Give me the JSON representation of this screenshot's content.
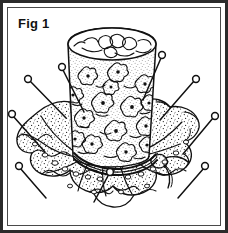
{
  "figure": {
    "caption": "Fig 1",
    "title": "Fig 1",
    "style": "black-and-white line drawing",
    "colors": {
      "background": "#ffffff",
      "ink": "#111111",
      "outer_border": "#2b2b2b",
      "inner_border": "#4a4a4a"
    },
    "illustration": {
      "body": {
        "name": "thimble-shaped pincushion body",
        "pattern": "small floral print with stipple shading",
        "top_shape": "ellipse",
        "taper": "wider at top, narrower at base"
      },
      "skirt": {
        "name": "ruffled fabric skirt",
        "edge": "scalloped lace ruffle",
        "texture": "stippled dots"
      },
      "cord": {
        "name": "tie cord",
        "position": "around base of body",
        "knot": "bow knot with tail at right"
      },
      "pins": {
        "count": 9,
        "head_shape": "round",
        "description": "straight pins with round heads stuck through the skirt"
      }
    }
  }
}
